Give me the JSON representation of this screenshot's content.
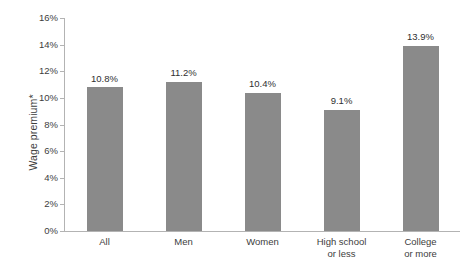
{
  "chart_data": {
    "type": "bar",
    "title": "",
    "subtitle": "",
    "xlabel": "",
    "ylabel": "Wage premium*",
    "categories": [
      "All",
      "Men",
      "Women",
      "High school or less",
      "College or more"
    ],
    "category_lines": [
      [
        "All"
      ],
      [
        "Men"
      ],
      [
        "Women"
      ],
      [
        "High school",
        "or less"
      ],
      [
        "College",
        "or more"
      ]
    ],
    "values": [
      10.8,
      11.2,
      10.4,
      9.1,
      13.9
    ],
    "value_labels": [
      "10.8%",
      "11.2%",
      "10.4%",
      "9.1%",
      "13.9%"
    ],
    "ylim": [
      0,
      16
    ],
    "ytick_values": [
      0,
      2,
      4,
      6,
      8,
      10,
      12,
      14,
      16
    ],
    "ytick_labels": [
      "0%",
      "2%",
      "4%",
      "6%",
      "8%",
      "10%",
      "12%",
      "14%",
      "16%"
    ],
    "grid": false,
    "legend": false,
    "legend_position": "none",
    "bar_color": "#8a8a8a",
    "axis_color": "#b3b3b3",
    "text_color": "#3d3d3d",
    "background_color": "#ffffff"
  }
}
